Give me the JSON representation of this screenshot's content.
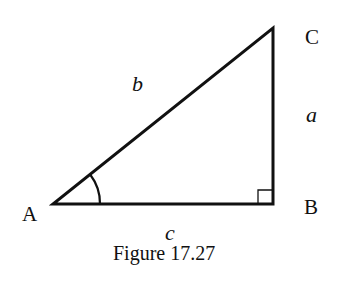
{
  "diagram": {
    "type": "right-triangle",
    "vertices": {
      "A": {
        "label": "A",
        "x": 53,
        "y": 204
      },
      "B": {
        "label": "B",
        "x": 273,
        "y": 204
      },
      "C": {
        "label": "C",
        "x": 273,
        "y": 28
      }
    },
    "sides": {
      "a": {
        "label": "a",
        "between": [
          "B",
          "C"
        ]
      },
      "b": {
        "label": "b",
        "between": [
          "A",
          "C"
        ]
      },
      "c": {
        "label": "c",
        "between": [
          "A",
          "B"
        ]
      }
    },
    "marks": {
      "angle_A": "arc",
      "right_angle_B": "square"
    },
    "caption": "Figure 17.27",
    "stroke_color": "#111111"
  }
}
